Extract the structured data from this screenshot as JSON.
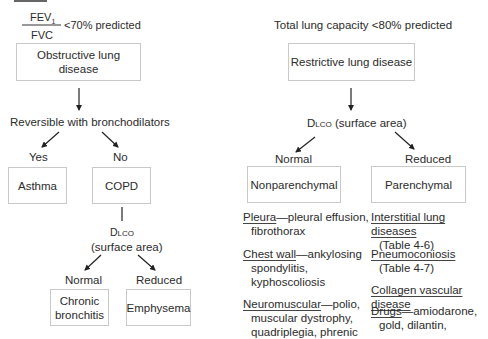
{
  "left": {
    "criterion": {
      "numerator": "FEV",
      "numerator_sub": "1",
      "denominator": "FVC",
      "threshold": "<70% predicted"
    },
    "main_box": "Obstructive lung disease",
    "question": "Reversible with bronchodilators",
    "yes_label": "Yes",
    "no_label": "No",
    "asthma_box": "Asthma",
    "copd_box": "COPD",
    "dlco_label": "Dlco",
    "dlco_sub": "(surface area)",
    "normal_label": "Normal",
    "reduced_label": "Reduced",
    "chronic_bronchitis_box": "Chronic bronchitis",
    "chronic_line1": "Chronic",
    "chronic_line2": "bronchitis",
    "emphysema_box": "Emphysema"
  },
  "right": {
    "criterion": "Total lung capacity <80% predicted",
    "main_box": "Restrictive lung disease",
    "dlco_label": "Dlco",
    "dlco_rest": " (surface area)",
    "normal_label": "Normal",
    "reduced_label": "Reduced",
    "nonparenchymal_box": "Nonparenchymal",
    "parenchymal_box": "Parenchymal",
    "nonparenchymal_items": [
      {
        "head": "Pleura",
        "rest": "—pleural effusion,",
        "lines": [
          "fibrothorax"
        ]
      },
      {
        "head": "Chest wall",
        "rest": "—ankylosing",
        "lines": [
          "spondylitis,",
          "kyphoscoliosis"
        ]
      },
      {
        "head": "Neuromuscular",
        "rest": "—polio,",
        "lines": [
          "muscular dystrophy,",
          "quadriplegia, phrenic"
        ]
      }
    ],
    "parenchymal_items": [
      {
        "head": "Interstitial lung diseases",
        "rest": "",
        "lines": [
          "(Table 4-6)"
        ]
      },
      {
        "head": "Pneumoconiosis",
        "rest": "",
        "lines": [
          "(Table 4-7)"
        ]
      },
      {
        "head": "Collagen vascular disease",
        "rest": "",
        "lines": []
      },
      {
        "head": "Drugs",
        "rest": "—amiodarone,",
        "lines": [
          "gold, dilantin,"
        ]
      }
    ]
  }
}
